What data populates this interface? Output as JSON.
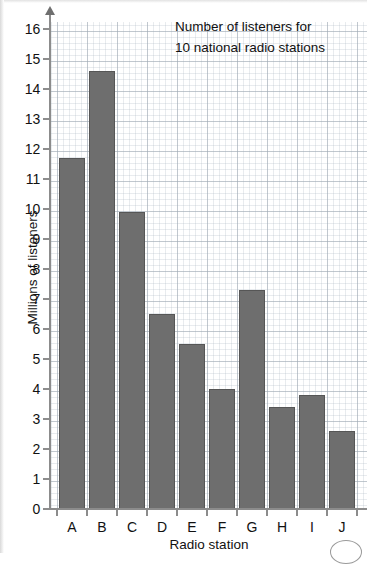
{
  "chart_data": {
    "type": "bar",
    "title": "Number of listeners for 10 national radio stations",
    "title_lines": [
      "Number of listeners for",
      "10 national radio stations"
    ],
    "xlabel": "Radio station",
    "ylabel": "Millions of listeners",
    "categories": [
      "A",
      "B",
      "C",
      "D",
      "E",
      "F",
      "G",
      "H",
      "I",
      "J"
    ],
    "values": [
      11.7,
      14.6,
      9.9,
      6.5,
      5.5,
      4.0,
      7.3,
      3.4,
      3.8,
      2.6
    ],
    "ylim": [
      0,
      16
    ],
    "ytick_step": 1,
    "ytick_labels": [
      "0",
      "1",
      "2",
      "3",
      "4",
      "5",
      "6",
      "7",
      "8",
      "9",
      "10",
      "11",
      "12",
      "13",
      "14",
      "15",
      "16"
    ],
    "grid": true,
    "grid_style": "graph-paper",
    "minor_grid_step": 0.2,
    "legend": null,
    "legend_position": "none",
    "bar_color": "#6e6e6e",
    "bar_edge_color": "#565656",
    "grid_color": "#a0aab4",
    "axis_color": "#8c8c8c",
    "text_color": "#111111",
    "background_color": "#ffffff"
  }
}
